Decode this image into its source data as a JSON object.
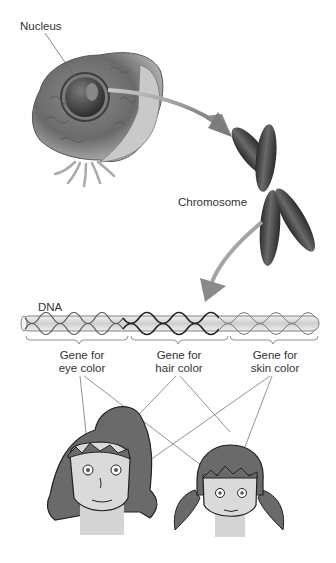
{
  "labels": {
    "nucleus": "Nucleus",
    "chromosome": "Chromosome",
    "dna": "DNA"
  },
  "genes": [
    {
      "line1": "Gene for",
      "line2": "eye color"
    },
    {
      "line1": "Gene for",
      "line2": "hair color"
    },
    {
      "line1": "Gene for",
      "line2": "skin color"
    }
  ],
  "colors": {
    "background": "#ffffff",
    "text": "#333333",
    "hair": "#6a6a6a",
    "skin": "#d9d9d9",
    "arrow": "#8a8a8a",
    "chromosome": "#4a4a4a"
  }
}
